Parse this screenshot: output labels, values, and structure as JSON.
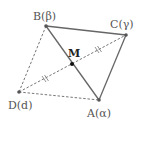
{
  "diagram": {
    "type": "geometry-quadrilateral",
    "points": {
      "A": {
        "label": "A(α)",
        "x": 99,
        "y": 100
      },
      "B": {
        "label": "B(β)",
        "x": 46,
        "y": 26
      },
      "C": {
        "label": "C(γ)",
        "x": 126,
        "y": 35
      },
      "D": {
        "label": "D(d)",
        "x": 19,
        "y": 92
      },
      "M": {
        "label": "M",
        "x": 72,
        "y": 64
      }
    },
    "segments": [
      {
        "from": "B",
        "to": "C",
        "style": "solid"
      },
      {
        "from": "C",
        "to": "A",
        "style": "solid"
      },
      {
        "from": "B",
        "to": "A",
        "style": "solid"
      },
      {
        "from": "B",
        "to": "D",
        "style": "dashed"
      },
      {
        "from": "D",
        "to": "A",
        "style": "dashed"
      },
      {
        "from": "D",
        "to": "C",
        "style": "dashed",
        "equal_marks": "DM = MC"
      }
    ],
    "colors": {
      "line": "#666666",
      "point": "#555555",
      "midpoint": "#111111"
    }
  }
}
